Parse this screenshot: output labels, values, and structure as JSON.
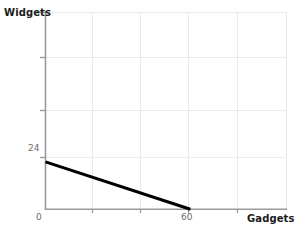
{
  "chart_data": {
    "type": "line",
    "title": "",
    "subtitle": "",
    "xlabel": "Gadgets",
    "ylabel": "Widgets",
    "xlim": [
      0,
      100
    ],
    "ylim": [
      0,
      100
    ],
    "grid": true,
    "legend": null,
    "x_ticks": [
      {
        "value": 0,
        "label": "0"
      },
      {
        "value": 60,
        "label": "60"
      }
    ],
    "y_ticks": [
      {
        "value": 24,
        "label": "24"
      }
    ],
    "gridlines": {
      "vertical_x": [
        20,
        40,
        60,
        80,
        100
      ],
      "horizontal_y": [
        40,
        62,
        84,
        100
      ]
    },
    "series": [
      {
        "name": "budget-constraint",
        "color": "#000000",
        "width": 3,
        "points": [
          {
            "x": 0,
            "y": 24
          },
          {
            "x": 60,
            "y": 0
          }
        ]
      }
    ],
    "annotations": []
  },
  "style": {
    "background": "#ffffff",
    "axis_color": "#9a9a9a",
    "grid_color": "#e9e9e9",
    "label_color": "#1a1a1a",
    "tick_color": "#6b6b6b",
    "line_color": "#000000"
  }
}
